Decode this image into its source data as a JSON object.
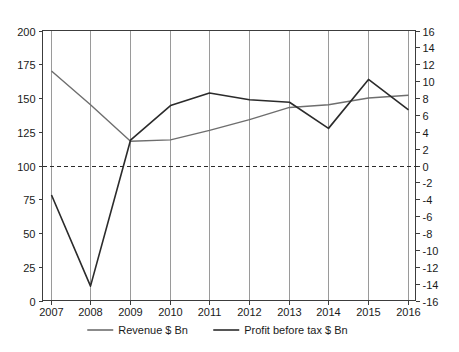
{
  "chart_data": {
    "type": "line",
    "title": "",
    "subtitle": "",
    "xlabel": "",
    "ylabel": "",
    "y2label": "",
    "grid": "vertical-only",
    "legend_position": "bottom",
    "categories": [
      "2007",
      "2008",
      "2009",
      "2010",
      "2011",
      "2012",
      "2013",
      "2014",
      "2015",
      "2016"
    ],
    "xlim": [
      2007,
      2016
    ],
    "ylim": [
      0,
      200
    ],
    "y2lim": [
      -16,
      16
    ],
    "yticks": [
      0,
      25,
      50,
      75,
      100,
      125,
      150,
      175,
      200
    ],
    "ytick_labels": [
      "0",
      "25",
      "50",
      "75",
      "100",
      "125",
      "150",
      "175",
      "200"
    ],
    "y2ticks": [
      -16,
      -14,
      -12,
      -10,
      -8,
      -6,
      -4,
      -2,
      0,
      2,
      4,
      6,
      8,
      10,
      12,
      14,
      16
    ],
    "y2tick_labels": [
      "-16",
      "-14",
      "-12",
      "-10",
      "-8",
      "-6",
      "-4",
      "-2",
      "0",
      "2",
      "4",
      "6",
      "8",
      "10",
      "12",
      "14",
      "16"
    ],
    "xtick_labels": [
      "2007",
      "2008",
      "2009",
      "2010",
      "2011",
      "2012",
      "2013",
      "2014",
      "2015",
      "2016"
    ],
    "reference_line": {
      "left_axis_value": 100,
      "right_axis_value": 0,
      "style": "dashed"
    },
    "series": [
      {
        "name": "Revenue $ Bn",
        "axis": "left",
        "color": "#6e6e6e",
        "values": [
          170,
          145,
          118,
          119,
          126,
          134,
          143,
          145,
          150,
          152
        ]
      },
      {
        "name": "Profit before tax $ Bn",
        "axis": "right",
        "color": "#2b2b2b",
        "values": [
          -3.5,
          -14.3,
          3.0,
          7.1,
          8.6,
          7.8,
          7.5,
          4.4,
          10.2,
          6.6
        ]
      }
    ]
  },
  "legend": {
    "items": [
      {
        "label": "Revenue $ Bn",
        "color": "#6e6e6e"
      },
      {
        "label": "Profit before tax $ Bn",
        "color": "#2b2b2b"
      }
    ]
  }
}
